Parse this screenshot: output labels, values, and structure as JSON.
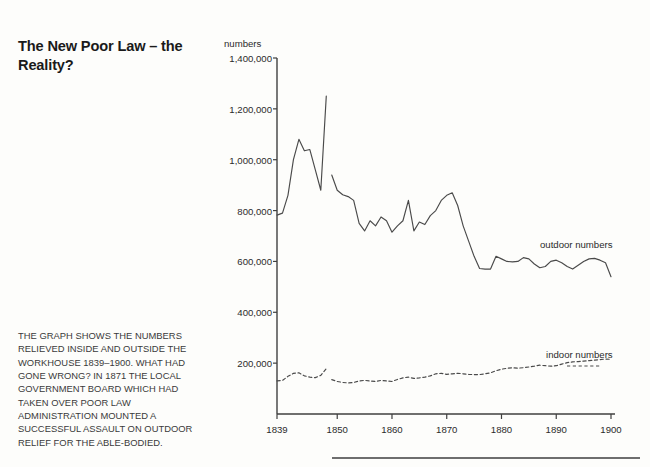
{
  "headline": "The New Poor Law – the Reality?",
  "body_lines": [
    "THE GRAPH SHOWS THE NUMBERS",
    "RELIEVED INSIDE AND OUTSIDE THE",
    "WORKHOUSE 1839–1900. WHAT HAD",
    "GONE WRONG? IN 1871 THE LOCAL",
    "GOVERNMENT BOARD WHICH HAD",
    "TAKEN OVER POOR LAW",
    "ADMINISTRATION MOUNTED A",
    "SUCCESSFUL ASSAULT ON OUTDOOR",
    "RELIEF FOR THE ABLE-BODIED."
  ],
  "chart_data": {
    "type": "line",
    "title": "",
    "xlabel": "",
    "ylabel": "numbers",
    "xlim": [
      1839,
      1900
    ],
    "ylim": [
      0,
      1400000
    ],
    "grid": false,
    "legend_position": "inline-right",
    "ytick_labels": [
      "1,400,000",
      "1,200,000",
      "1,000,000",
      "800,000",
      "600,000",
      "400,000",
      "200,000"
    ],
    "ytick_values": [
      1400000,
      1200000,
      1000000,
      800000,
      600000,
      400000,
      200000
    ],
    "xtick_labels": [
      "1839",
      "1850",
      "1860",
      "1870",
      "1880",
      "1890",
      "1900"
    ],
    "xtick_values": [
      1839,
      1850,
      1860,
      1870,
      1880,
      1890,
      1900
    ],
    "series": [
      {
        "name": "outdoor numbers",
        "style": "solid",
        "color": "#4a4a4a",
        "segments": [
          {
            "x": [
              1839,
              1840,
              1841,
              1842,
              1843,
              1844,
              1845,
              1846,
              1847,
              1848
            ],
            "values": [
              782000,
              790000,
              860000,
              1000000,
              1080000,
              1035000,
              1040000,
              960000,
              880000,
              1250000
            ]
          },
          {
            "x": [
              1849,
              1850,
              1851,
              1852,
              1853,
              1854,
              1855,
              1856,
              1857,
              1858,
              1859,
              1860,
              1861,
              1862,
              1863,
              1864,
              1865,
              1866,
              1867,
              1868,
              1869,
              1870,
              1871,
              1872,
              1873,
              1874,
              1875,
              1876,
              1877,
              1878,
              1879,
              1880,
              1881,
              1882,
              1883,
              1884,
              1885,
              1886,
              1887,
              1888,
              1889,
              1890,
              1891,
              1892,
              1893,
              1894,
              1895,
              1896,
              1897,
              1898,
              1899,
              1900
            ],
            "values": [
              940000,
              880000,
              862000,
              855000,
              840000,
              750000,
              720000,
              760000,
              740000,
              775000,
              760000,
              715000,
              740000,
              760000,
              840000,
              720000,
              755000,
              745000,
              780000,
              800000,
              840000,
              860000,
              870000,
              820000,
              740000,
              680000,
              620000,
              572000,
              570000,
              570000,
              620000,
              610000,
              600000,
              598000,
              600000,
              615000,
              610000,
              590000,
              575000,
              580000,
              600000,
              605000,
              595000,
              580000,
              570000,
              585000,
              600000,
              610000,
              612000,
              605000,
              595000,
              540000
            ]
          }
        ]
      },
      {
        "name": "indoor numbers",
        "style": "dashed",
        "color": "#4a4a4a",
        "segments": [
          {
            "x": [
              1839,
              1840,
              1841,
              1842,
              1843,
              1844,
              1845,
              1846,
              1847,
              1848
            ],
            "values": [
              130000,
              132000,
              148000,
              160000,
              162000,
              150000,
              145000,
              143000,
              152000,
              178000
            ]
          },
          {
            "x": [
              1849,
              1850,
              1851,
              1852,
              1853,
              1854,
              1855,
              1856,
              1857,
              1858,
              1859,
              1860,
              1861,
              1862,
              1863,
              1864,
              1865,
              1866,
              1867,
              1868,
              1869,
              1870,
              1871,
              1872,
              1873,
              1874,
              1875,
              1876,
              1877,
              1878,
              1879,
              1880,
              1881,
              1882,
              1883,
              1884,
              1885,
              1886,
              1887,
              1888,
              1889,
              1890,
              1891,
              1892,
              1893,
              1894,
              1895,
              1896,
              1897,
              1898,
              1899,
              1900
            ],
            "values": [
              135000,
              128000,
              124000,
              122000,
              124000,
              130000,
              132000,
              130000,
              128000,
              132000,
              130000,
              128000,
              136000,
              142000,
              145000,
              140000,
              142000,
              145000,
              150000,
              158000,
              160000,
              156000,
              158000,
              160000,
              158000,
              156000,
              155000,
              155000,
              158000,
              162000,
              170000,
              176000,
              180000,
              182000,
              180000,
              182000,
              185000,
              188000,
              192000,
              190000,
              188000,
              190000,
              196000,
              202000,
              205000,
              206000,
              208000,
              210000,
              212000,
              214000,
              216000,
              215000
            ]
          }
        ]
      }
    ]
  }
}
